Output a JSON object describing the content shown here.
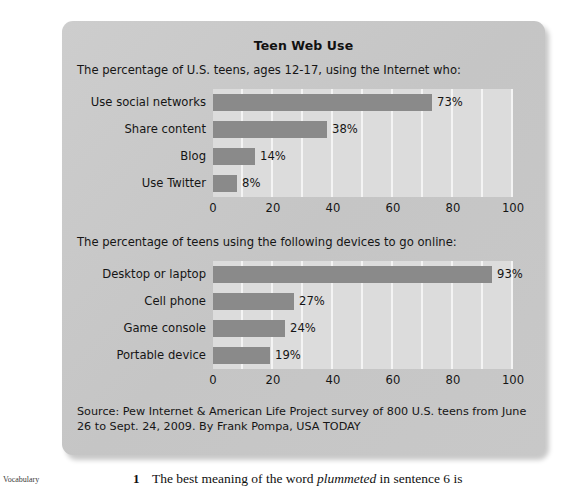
{
  "panel": {
    "title": "Teen Web Use",
    "source": "Source: Pew Internet & American Life Project survey of 800 U.S. teens from June 26 to Sept. 24, 2009. By Frank Pompa, USA TODAY"
  },
  "sections": [
    {
      "subtitle": "The percentage of U.S. teens, ages 12-17, using the Internet who:"
    },
    {
      "subtitle": "The percentage of teens using the following devices to go online:"
    }
  ],
  "axis": {
    "ticks": [
      "0",
      "20",
      "40",
      "60",
      "80",
      "100"
    ],
    "min": 0,
    "max": 100
  },
  "page_text": {
    "margin_label": "Vocabulary",
    "question_number": "1",
    "question_prefix": "The best meaning of the word ",
    "question_italic": "plummeted",
    "question_suffix": " in sentence 6 is"
  },
  "colors": {
    "panel_background": "#c9c9c9",
    "plot_background": "#dcdcdc",
    "gridline": "#f4f4f4",
    "bar": "#8a8a8a",
    "text": "#151515"
  },
  "chart_data": [
    {
      "type": "bar",
      "orientation": "horizontal",
      "title": "Teen Web Use",
      "subtitle": "The percentage of U.S. teens, ages 12-17, using the Internet who:",
      "categories": [
        "Use social networks",
        "Share content",
        "Blog",
        "Use Twitter"
      ],
      "values": [
        73,
        38,
        14,
        8
      ],
      "value_labels": [
        "73%",
        "38%",
        "14%",
        "8%"
      ],
      "xlabel": "",
      "ylabel": "",
      "xlim": [
        0,
        100
      ],
      "xticks": [
        0,
        20,
        40,
        60,
        80,
        100
      ],
      "grid": true,
      "legend": "none"
    },
    {
      "type": "bar",
      "orientation": "horizontal",
      "title": "",
      "subtitle": "The percentage of teens using the following devices to go online:",
      "categories": [
        "Desktop or laptop",
        "Cell phone",
        "Game console",
        "Portable device"
      ],
      "values": [
        93,
        27,
        24,
        19
      ],
      "value_labels": [
        "93%",
        "27%",
        "24%",
        "19%"
      ],
      "xlabel": "",
      "ylabel": "",
      "xlim": [
        0,
        100
      ],
      "xticks": [
        0,
        20,
        40,
        60,
        80,
        100
      ],
      "grid": true,
      "legend": "none"
    }
  ]
}
